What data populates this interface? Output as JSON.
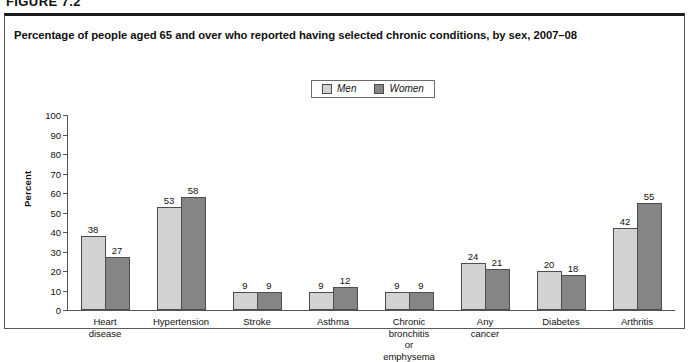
{
  "figure_number": "FIGURE 7.2",
  "title": "Percentage of people aged 65 and over who reported having selected chronic conditions, by sex, 2007–08",
  "legend": {
    "men_label": "Men",
    "women_label": "Women",
    "men_color": "#d2d2d2",
    "women_color": "#858585"
  },
  "axis": {
    "y_title": "Percent",
    "y_ticks": [
      "100",
      "90",
      "80",
      "70",
      "60",
      "50",
      "40",
      "30",
      "20",
      "10",
      "0"
    ]
  },
  "chart_data": {
    "type": "bar",
    "title": "Percentage of people aged 65 and over who reported having selected chronic conditions, by sex, 2007–08",
    "xlabel": "",
    "ylabel": "Percent",
    "ylim": [
      0,
      100
    ],
    "ytick_step": 10,
    "grid": false,
    "legend_position": "top-center",
    "categories": [
      "Heart disease",
      "Hypertension",
      "Stroke",
      "Asthma",
      "Chronic bronchitis\nor emphysema",
      "Any cancer",
      "Diabetes",
      "Arthritis"
    ],
    "series": [
      {
        "name": "Men",
        "color": "#d2d2d2",
        "values": [
          38,
          53,
          9,
          9,
          9,
          24,
          20,
          42
        ]
      },
      {
        "name": "Women",
        "color": "#858585",
        "values": [
          27,
          58,
          9,
          12,
          9,
          21,
          18,
          55
        ]
      }
    ]
  }
}
